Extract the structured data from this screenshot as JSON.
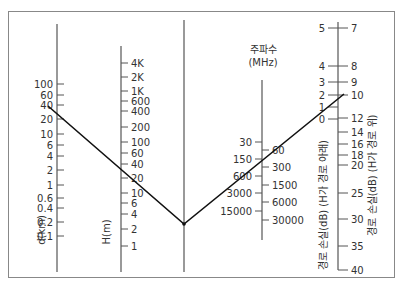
{
  "diagram": {
    "type": "nomogram",
    "axes": {
      "distance": {
        "title": "d(km)",
        "ticks": [
          "100",
          "60",
          "40",
          "20",
          "10",
          "6",
          "4",
          "2",
          "1",
          "0.6",
          "0.4",
          "0.2",
          "0.1"
        ]
      },
      "height": {
        "title": "H(m)",
        "ticks": [
          "4K",
          "2K",
          "1K",
          "600",
          "400",
          "200",
          "100",
          "60",
          "40",
          "20",
          "10",
          "6",
          "4",
          "2",
          "1"
        ]
      },
      "frequency": {
        "title_line1": "주파수",
        "title_line2": "(MHz)",
        "left_ticks": [
          "30",
          "150",
          "600",
          "3000",
          "15000"
        ],
        "right_ticks": [
          "60",
          "300",
          "1500",
          "6000",
          "30000"
        ]
      },
      "path_loss": {
        "left_title": "경로 손실(dB) (H가 경로 아래)",
        "right_title": "경로 손실(dB) (H가 경로 위)",
        "left_ticks": [
          "5",
          "4",
          "3",
          "2",
          "1",
          "0"
        ],
        "right_ticks": [
          "7",
          "8",
          "9",
          "10",
          "12",
          "14",
          "16",
          "18",
          "20",
          "25",
          "30",
          "35",
          "40"
        ]
      }
    },
    "example_line": {
      "distance_km": 10,
      "height_m": 20,
      "pivot": "center reference line",
      "frequency_mhz": 150,
      "path_loss_db": 10
    }
  }
}
